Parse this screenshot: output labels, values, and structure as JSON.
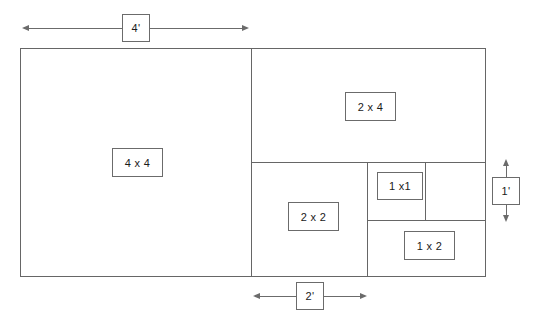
{
  "diagram": {
    "stroke_color": "#666666",
    "text_color": "#1a1a1a",
    "background": "#ffffff",
    "outer_rect": {
      "x": 20,
      "y": 48,
      "width": 465,
      "height": 228
    },
    "regions": [
      {
        "id": "region-4x4",
        "label": "4 x 4",
        "x": 20,
        "y": 48,
        "width": 231,
        "height": 228
      },
      {
        "id": "region-2x4",
        "label": "2 x 4",
        "x": 251,
        "y": 48,
        "width": 234,
        "height": 114
      },
      {
        "id": "region-2x2",
        "label": "2 x 2",
        "x": 251,
        "y": 162,
        "width": 116,
        "height": 114
      },
      {
        "id": "region-1x1",
        "label": "1 x1",
        "x": 367,
        "y": 162,
        "width": 58,
        "height": 58
      },
      {
        "id": "region-blank",
        "label": "",
        "x": 425,
        "y": 162,
        "width": 60,
        "height": 58
      },
      {
        "id": "region-1x2",
        "label": "1 x 2",
        "x": 367,
        "y": 220,
        "width": 118,
        "height": 56
      }
    ],
    "labels": [
      {
        "id": "label-4x4",
        "text": "4 x 4",
        "x": 112,
        "y": 148,
        "width": 51,
        "height": 29
      },
      {
        "id": "label-2x4",
        "text": "2 x 4",
        "x": 345,
        "y": 92,
        "width": 51,
        "height": 29
      },
      {
        "id": "label-2x2",
        "text": "2 x 2",
        "x": 288,
        "y": 202,
        "width": 51,
        "height": 29
      },
      {
        "id": "label-1x1",
        "text": "1 x1",
        "x": 377,
        "y": 172,
        "width": 46,
        "height": 28
      },
      {
        "id": "label-1x2",
        "text": "1 x 2",
        "x": 404,
        "y": 231,
        "width": 51,
        "height": 29
      }
    ],
    "dimensions": [
      {
        "id": "dimension-width-4ft",
        "text": "4'",
        "orientation": "horizontal",
        "start": 22,
        "end": 249,
        "axis": 28,
        "box": {
          "x": 122,
          "y": 14,
          "width": 28,
          "height": 28
        }
      },
      {
        "id": "dimension-width-2ft",
        "text": "2'",
        "orientation": "horizontal",
        "start": 253,
        "end": 367,
        "axis": 296,
        "box": {
          "x": 296,
          "y": 282,
          "width": 28,
          "height": 28
        }
      },
      {
        "id": "dimension-height-1ft",
        "text": "1'",
        "orientation": "vertical",
        "start": 161,
        "end": 221,
        "axis": 506,
        "box": {
          "x": 492,
          "y": 177,
          "width": 28,
          "height": 28
        }
      }
    ]
  }
}
